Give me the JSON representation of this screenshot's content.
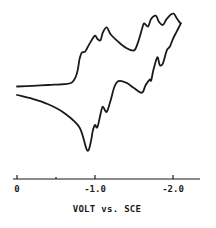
{
  "chart_data": {
    "type": "line",
    "title": "",
    "xlabel": "VOLT vs. SCE",
    "ylabel": "",
    "xlim": [
      0.05,
      -2.3
    ],
    "ylim": [
      -1.0,
      1.0
    ],
    "x_ticks": [
      {
        "value": 0,
        "label": "0"
      },
      {
        "value": -0.5,
        "label": ""
      },
      {
        "value": -1.0,
        "label": "-1.0"
      },
      {
        "value": -2.0,
        "label": "-2.0"
      }
    ],
    "grid": false,
    "legend": "none",
    "series": [
      {
        "name": "cathodic (forward) scan",
        "x": [
          0.0,
          -0.2,
          -0.4,
          -0.6,
          -0.7,
          -0.75,
          -0.78,
          -0.8,
          -0.83,
          -0.87,
          -0.9,
          -0.95,
          -1.0,
          -1.03,
          -1.07,
          -1.1,
          -1.15,
          -1.2,
          -1.3,
          -1.4,
          -1.5,
          -1.55,
          -1.6,
          -1.63,
          -1.68,
          -1.72,
          -1.78,
          -1.82,
          -1.87,
          -1.92,
          -2.0,
          -2.04,
          -2.08,
          -2.1
        ],
        "y": [
          -0.02,
          -0.01,
          0.0,
          0.01,
          0.03,
          0.1,
          0.2,
          0.33,
          0.42,
          0.43,
          0.48,
          0.57,
          0.64,
          0.6,
          0.58,
          0.68,
          0.75,
          0.66,
          0.56,
          0.48,
          0.45,
          0.55,
          0.72,
          0.8,
          0.76,
          0.86,
          0.9,
          0.82,
          0.78,
          0.86,
          0.93,
          0.88,
          0.82,
          0.8
        ]
      },
      {
        "name": "anodic (reverse) scan",
        "x": [
          -2.1,
          -2.05,
          -2.0,
          -1.96,
          -1.92,
          -1.87,
          -1.83,
          -1.8,
          -1.75,
          -1.72,
          -1.7,
          -1.65,
          -1.6,
          -1.5,
          -1.4,
          -1.3,
          -1.25,
          -1.2,
          -1.15,
          -1.1,
          -1.07,
          -1.03,
          -1.0,
          -0.97,
          -0.95,
          -0.9,
          -0.8,
          -0.6,
          -0.4,
          -0.2,
          0.0
        ],
        "y": [
          0.8,
          0.7,
          0.6,
          0.5,
          0.45,
          0.28,
          0.26,
          0.36,
          0.2,
          0.06,
          0.07,
          0.0,
          -0.1,
          -0.04,
          0.03,
          0.05,
          -0.02,
          -0.2,
          -0.35,
          -0.28,
          -0.38,
          -0.55,
          -0.52,
          -0.6,
          -0.72,
          -0.85,
          -0.55,
          -0.36,
          -0.25,
          -0.18,
          -0.13
        ]
      }
    ]
  }
}
